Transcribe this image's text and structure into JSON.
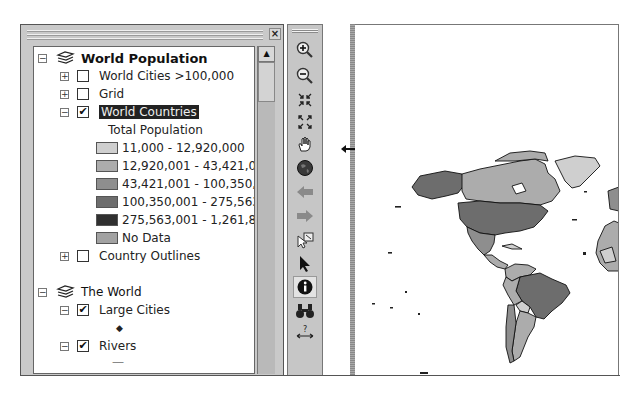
{
  "toc": {
    "close_label": "×",
    "groups": [
      {
        "label": "World Population",
        "expanded": true,
        "layers": [
          {
            "label": "World Cities >100,000",
            "checked": false,
            "expanded": false
          },
          {
            "label": "Grid",
            "checked": false,
            "expanded": false
          },
          {
            "label": "World Countries",
            "checked": true,
            "expanded": true,
            "selected": true,
            "legend": {
              "field": "Total Population",
              "classes": [
                {
                  "label": "11,000 - 12,920,000",
                  "color": "#cfcfcf"
                },
                {
                  "label": "12,920,001 - 43,421,0",
                  "color": "#acacac"
                },
                {
                  "label": "43,421,001 - 100,350,",
                  "color": "#8e8e8e"
                },
                {
                  "label": "100,350,001 - 275,563",
                  "color": "#6d6d6d"
                },
                {
                  "label": "275,563,001 - 1,261,8",
                  "color": "#303030"
                },
                {
                  "label": "No Data",
                  "color": "#a2a2a2"
                }
              ]
            }
          },
          {
            "label": "Country Outlines",
            "checked": false,
            "expanded": false
          }
        ]
      },
      {
        "label": "The World",
        "expanded": true,
        "layers": [
          {
            "label": "Large Cities",
            "checked": true,
            "expanded": true,
            "symbol": "◆"
          },
          {
            "label": "Rivers",
            "checked": true,
            "expanded": true,
            "symbol": "—"
          }
        ]
      }
    ]
  },
  "tools": {
    "items": [
      {
        "name": "zoom-in-icon"
      },
      {
        "name": "zoom-out-icon"
      },
      {
        "name": "fixed-zoom-in-icon"
      },
      {
        "name": "fixed-zoom-out-icon"
      },
      {
        "name": "pan-hand-icon"
      },
      {
        "name": "full-extent-globe-icon"
      },
      {
        "name": "back-arrow-icon"
      },
      {
        "name": "forward-arrow-icon"
      },
      {
        "name": "select-features-icon"
      },
      {
        "name": "select-elements-pointer-icon"
      },
      {
        "name": "identify-icon",
        "active": true
      },
      {
        "name": "find-binoculars-icon"
      },
      {
        "name": "measure-icon"
      }
    ]
  },
  "map": {
    "view": "Americas and western Africa, World Countries colored by Total Population"
  }
}
